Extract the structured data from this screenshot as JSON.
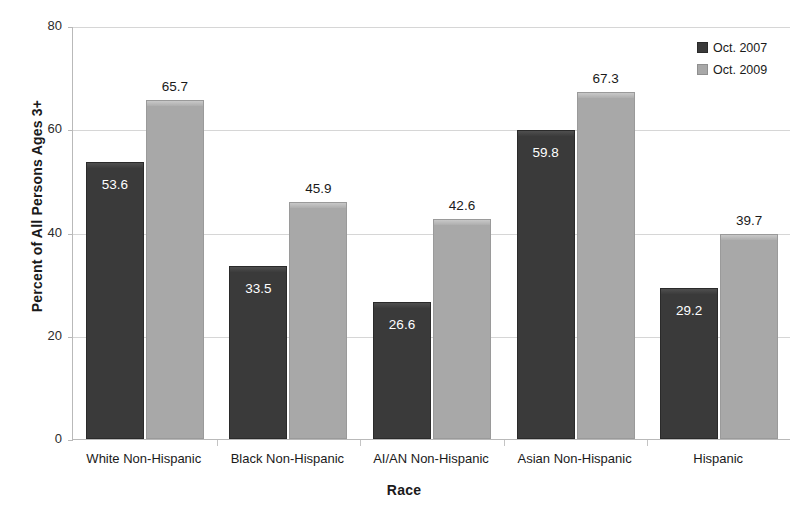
{
  "chart_data": {
    "type": "bar",
    "title": "",
    "xlabel": "Race",
    "ylabel": "Percent of All Persons Ages 3+",
    "ylim": [
      0,
      80
    ],
    "yticks": [
      0,
      20,
      40,
      60,
      80
    ],
    "grid": true,
    "legend_position": "top-right",
    "categories": [
      "White Non-Hispanic",
      "Black Non-Hispanic",
      "AI/AN Non-Hispanic",
      "Asian Non-Hispanic",
      "Hispanic"
    ],
    "series": [
      {
        "name": "Oct. 2007",
        "color": "#3a3a3a",
        "label_color": "#ffffff",
        "label_position": "inside",
        "values": [
          53.6,
          33.5,
          26.6,
          59.8,
          29.2
        ],
        "value_labels": [
          "53.6",
          "33.5",
          "26.6",
          "59.8",
          "29.2"
        ]
      },
      {
        "name": "Oct. 2009",
        "color": "#a8a8a8",
        "label_color": "#1a1a1a",
        "label_position": "above",
        "values": [
          65.7,
          45.9,
          42.6,
          67.3,
          39.7
        ],
        "value_labels": [
          "65.7",
          "45.9",
          "42.6",
          "67.3",
          "39.7"
        ]
      }
    ],
    "ytick_labels": [
      "0",
      "20",
      "40",
      "60",
      "80"
    ]
  }
}
